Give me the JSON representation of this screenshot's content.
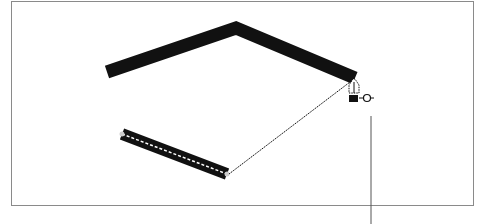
{
  "figure": {
    "caption_partial": "",
    "colors": {
      "frame": "#8a8a8a",
      "stroke": "#111111",
      "leader": "#555555",
      "background": "#ffffff"
    },
    "cursor": {
      "icon": "pen-tool-close-path-icon"
    }
  }
}
